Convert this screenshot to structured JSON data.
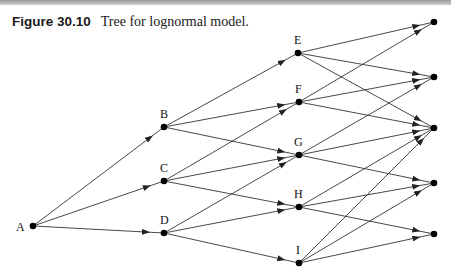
{
  "caption": {
    "figure_number": "Figure 30.10",
    "title": "Tree for lognormal model."
  },
  "diagram": {
    "type": "recombining-tree",
    "nodes": [
      {
        "id": "A",
        "label": "A",
        "x": 33,
        "y": 226,
        "lx": 16,
        "ly": 231
      },
      {
        "id": "B",
        "label": "B",
        "x": 164,
        "y": 127,
        "lx": 160,
        "ly": 118
      },
      {
        "id": "C",
        "label": "C",
        "x": 164,
        "y": 181,
        "lx": 160,
        "ly": 172
      },
      {
        "id": "D",
        "label": "D",
        "x": 164,
        "y": 233,
        "lx": 160,
        "ly": 224
      },
      {
        "id": "E",
        "label": "E",
        "x": 298,
        "y": 53,
        "lx": 294,
        "ly": 44
      },
      {
        "id": "F",
        "label": "F",
        "x": 299,
        "y": 102,
        "lx": 295,
        "ly": 93
      },
      {
        "id": "G",
        "label": "G",
        "x": 299,
        "y": 155,
        "lx": 294,
        "ly": 146
      },
      {
        "id": "H",
        "label": "H",
        "x": 299,
        "y": 207,
        "lx": 294,
        "ly": 198
      },
      {
        "id": "I",
        "label": "I",
        "x": 299,
        "y": 263,
        "lx": 296,
        "ly": 254
      },
      {
        "id": "R1",
        "label": "",
        "x": 434,
        "y": 22
      },
      {
        "id": "R2",
        "label": "",
        "x": 434,
        "y": 77
      },
      {
        "id": "R3",
        "label": "",
        "x": 434,
        "y": 128
      },
      {
        "id": "R4",
        "label": "",
        "x": 434,
        "y": 183
      },
      {
        "id": "R5",
        "label": "",
        "x": 434,
        "y": 234
      }
    ],
    "edges": [
      [
        "A",
        "B"
      ],
      [
        "A",
        "C"
      ],
      [
        "A",
        "D"
      ],
      [
        "B",
        "E"
      ],
      [
        "B",
        "F"
      ],
      [
        "B",
        "G"
      ],
      [
        "C",
        "F"
      ],
      [
        "C",
        "G"
      ],
      [
        "C",
        "H"
      ],
      [
        "D",
        "G"
      ],
      [
        "D",
        "H"
      ],
      [
        "D",
        "I"
      ],
      [
        "E",
        "R1"
      ],
      [
        "E",
        "R2"
      ],
      [
        "E",
        "R3"
      ],
      [
        "F",
        "R1"
      ],
      [
        "F",
        "R2"
      ],
      [
        "F",
        "R3"
      ],
      [
        "G",
        "R2"
      ],
      [
        "G",
        "R3"
      ],
      [
        "G",
        "R4"
      ],
      [
        "H",
        "R3"
      ],
      [
        "H",
        "R4"
      ],
      [
        "H",
        "R5"
      ],
      [
        "I",
        "R3"
      ],
      [
        "I",
        "R4"
      ],
      [
        "I",
        "R5"
      ]
    ],
    "colors": {
      "line": "#333333",
      "node": "#000000"
    }
  }
}
